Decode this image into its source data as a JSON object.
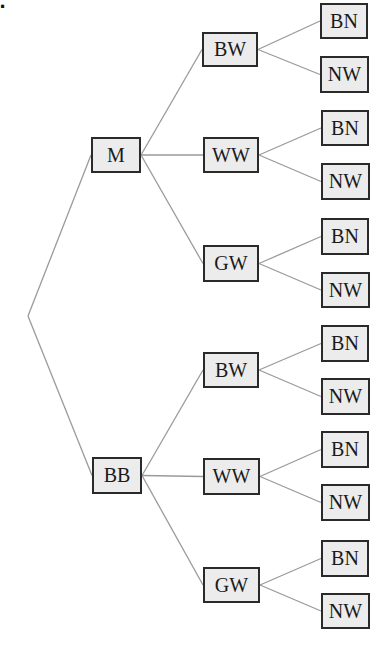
{
  "part_label": "b.",
  "colors": {
    "box_fill": "#ececec",
    "box_border": "#2a2a2a",
    "line": "#9a9a9a"
  },
  "root": {
    "x": 28,
    "y": 316
  },
  "nodes": [
    {
      "id": "m",
      "label": "M",
      "x": 91,
      "y": 137,
      "w": 50,
      "h": 36,
      "parent": "root"
    },
    {
      "id": "bb",
      "label": "BB",
      "x": 92,
      "y": 457,
      "w": 50,
      "h": 37,
      "parent": "root"
    },
    {
      "id": "m-bw",
      "label": "BW",
      "x": 202,
      "y": 32,
      "w": 56,
      "h": 35,
      "parent": "m"
    },
    {
      "id": "m-ww",
      "label": "WW",
      "x": 203,
      "y": 137,
      "w": 56,
      "h": 36,
      "parent": "m"
    },
    {
      "id": "m-gw",
      "label": "GW",
      "x": 203,
      "y": 245,
      "w": 56,
      "h": 37,
      "parent": "m"
    },
    {
      "id": "bb-bw",
      "label": "BW",
      "x": 203,
      "y": 352,
      "w": 56,
      "h": 36,
      "parent": "bb"
    },
    {
      "id": "bb-ww",
      "label": "WW",
      "x": 203,
      "y": 458,
      "w": 57,
      "h": 37,
      "parent": "bb"
    },
    {
      "id": "bb-gw",
      "label": "GW",
      "x": 203,
      "y": 567,
      "w": 57,
      "h": 36,
      "parent": "bb"
    },
    {
      "id": "m-bw-bn",
      "label": "BN",
      "x": 320,
      "y": 3,
      "w": 48,
      "h": 36,
      "parent": "m-bw"
    },
    {
      "id": "m-bw-nw",
      "label": "NW",
      "x": 320,
      "y": 56,
      "w": 49,
      "h": 37,
      "parent": "m-bw"
    },
    {
      "id": "m-ww-bn",
      "label": "BN",
      "x": 321,
      "y": 110,
      "w": 48,
      "h": 36,
      "parent": "m-ww"
    },
    {
      "id": "m-ww-nw",
      "label": "NW",
      "x": 321,
      "y": 163,
      "w": 49,
      "h": 37,
      "parent": "m-ww"
    },
    {
      "id": "m-gw-bn",
      "label": "BN",
      "x": 321,
      "y": 218,
      "w": 48,
      "h": 37,
      "parent": "m-gw"
    },
    {
      "id": "m-gw-nw",
      "label": "NW",
      "x": 321,
      "y": 272,
      "w": 49,
      "h": 36,
      "parent": "m-gw"
    },
    {
      "id": "bb-bw-bn",
      "label": "BN",
      "x": 321,
      "y": 325,
      "w": 48,
      "h": 37,
      "parent": "bb-bw"
    },
    {
      "id": "bb-bw-nw",
      "label": "NW",
      "x": 321,
      "y": 378,
      "w": 49,
      "h": 37,
      "parent": "bb-bw"
    },
    {
      "id": "bb-ww-bn",
      "label": "BN",
      "x": 321,
      "y": 431,
      "w": 48,
      "h": 37,
      "parent": "bb-ww"
    },
    {
      "id": "bb-ww-nw",
      "label": "NW",
      "x": 321,
      "y": 484,
      "w": 49,
      "h": 37,
      "parent": "bb-ww"
    },
    {
      "id": "bb-gw-bn",
      "label": "BN",
      "x": 321,
      "y": 540,
      "w": 48,
      "h": 37,
      "parent": "bb-gw"
    },
    {
      "id": "bb-gw-nw",
      "label": "NW",
      "x": 321,
      "y": 593,
      "w": 49,
      "h": 36,
      "parent": "bb-gw"
    }
  ]
}
